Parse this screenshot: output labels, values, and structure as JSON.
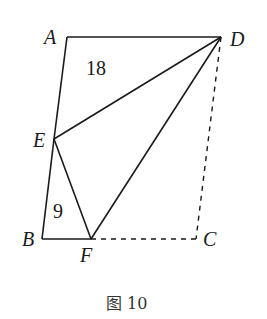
{
  "diagram": {
    "points": {
      "A": {
        "label": "A",
        "x": 67,
        "y": 37
      },
      "D": {
        "label": "D",
        "x": 221,
        "y": 37
      },
      "E": {
        "label": "E",
        "x": 54,
        "y": 139
      },
      "B": {
        "label": "B",
        "x": 42,
        "y": 239
      },
      "F": {
        "label": "F",
        "x": 91,
        "y": 239
      },
      "C": {
        "label": "C",
        "x": 196,
        "y": 239
      }
    },
    "solid_segments": [
      "AD",
      "AE",
      "EB",
      "BF",
      "ED",
      "EF",
      "FD"
    ],
    "dashed_segments": [
      "DC",
      "FC"
    ],
    "area_labels": [
      {
        "region": "triangle AED",
        "value": "18"
      },
      {
        "region": "triangle BEF",
        "value": "9"
      }
    ],
    "caption": "图 10"
  }
}
